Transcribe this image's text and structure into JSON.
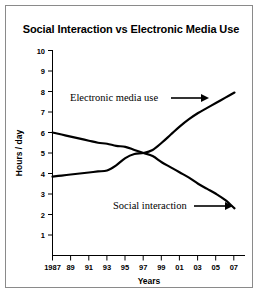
{
  "figure": {
    "title": "Social Interaction vs Electronic Media Use",
    "background_color": "#ffffff",
    "border_color": "#8a8a8a",
    "line_color": "#000000"
  },
  "chart_data": {
    "type": "line",
    "title": "Social Interaction vs Electronic Media Use",
    "xlabel": "Years",
    "ylabel": "Hours / day",
    "x": [
      1987,
      1988,
      1989,
      1990,
      1991,
      1992,
      1993,
      1994,
      1995,
      1996,
      1997,
      1998,
      1999,
      2000,
      2001,
      2002,
      2003,
      2004,
      2005,
      2006,
      2007
    ],
    "xtick_labels": [
      "1987",
      "89",
      "91",
      "93",
      "95",
      "97",
      "99",
      "01",
      "03",
      "05",
      "07"
    ],
    "xtick_values": [
      1987,
      1989,
      1991,
      1993,
      1995,
      1997,
      1999,
      2001,
      2003,
      2005,
      2007
    ],
    "ytick_labels": [
      "1",
      "2",
      "3",
      "4",
      "5",
      "6",
      "7",
      "8",
      "9",
      "10"
    ],
    "ytick_values": [
      1,
      2,
      3,
      4,
      5,
      6,
      7,
      8,
      9,
      10
    ],
    "xlim": [
      1987,
      2007.5
    ],
    "ylim": [
      0,
      10
    ],
    "grid": false,
    "legend": "annotations",
    "series": [
      {
        "name": "Social interaction",
        "label": "Social interaction",
        "color": "#000000",
        "values": [
          6.0,
          5.9,
          5.8,
          5.7,
          5.6,
          5.5,
          5.45,
          5.35,
          5.3,
          5.15,
          5.0,
          4.85,
          4.55,
          4.3,
          4.05,
          3.8,
          3.5,
          3.25,
          3.0,
          2.7,
          2.3
        ]
      },
      {
        "name": "Electronic media use",
        "label": "Electronic media use",
        "color": "#000000",
        "values": [
          3.85,
          3.9,
          3.95,
          4.0,
          4.05,
          4.1,
          4.15,
          4.4,
          4.75,
          4.95,
          5.0,
          5.15,
          5.5,
          5.9,
          6.3,
          6.65,
          6.95,
          7.2,
          7.45,
          7.7,
          7.95
        ]
      }
    ],
    "annotations": [
      {
        "text": "Electronic media use",
        "x_px": 70,
        "y_px": 101,
        "arrow_from_px": [
          171,
          98
        ],
        "arrow_to_px": [
          206,
          98
        ]
      },
      {
        "text": "Social interaction",
        "x_px": 113,
        "y_px": 209,
        "arrow_from_px": [
          194,
          206
        ],
        "arrow_to_px": [
          230,
          206
        ]
      }
    ]
  }
}
